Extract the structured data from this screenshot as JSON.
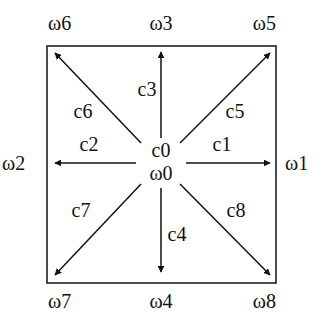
{
  "diagram": {
    "colors": {
      "stroke": "#111111",
      "background": "#ffffff"
    },
    "box": {
      "x": 47,
      "y": 46,
      "width": 229,
      "height": 237
    },
    "center": {
      "c_label": "c0",
      "w_label": "ω0"
    },
    "corner_labels": {
      "w6": "ω6",
      "w3": "ω3",
      "w5": "ω5",
      "w2": "ω2",
      "w1": "ω1",
      "w7": "ω7",
      "w4": "ω4",
      "w8": "ω8"
    },
    "arrow_labels": {
      "c1": "c1",
      "c2": "c2",
      "c3": "c3",
      "c4": "c4",
      "c5": "c5",
      "c6": "c6",
      "c7": "c7",
      "c8": "c8"
    }
  }
}
